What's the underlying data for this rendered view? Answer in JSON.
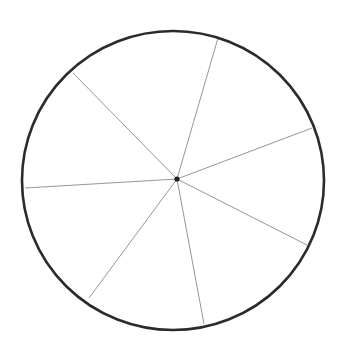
{
  "figure": {
    "background": "#ffffff",
    "circle": {
      "cx": 173,
      "cy": 180.5,
      "rx": 151,
      "ry": 149.5,
      "stroke": "#2b2b2b",
      "stroke_width": 2.6
    },
    "center_point": {
      "x": 177,
      "y": 179,
      "r": 2.6,
      "fill": "#1e1e1e"
    },
    "spoke_style": {
      "stroke": "#8a8a8a",
      "stroke_width": 0.9
    },
    "spokes": [
      {
        "x": 218,
        "y": 38
      },
      {
        "x": 73,
        "y": 73
      },
      {
        "x": 25,
        "y": 188
      },
      {
        "x": 89,
        "y": 298
      },
      {
        "x": 204,
        "y": 324
      },
      {
        "x": 307,
        "y": 245
      },
      {
        "x": 312,
        "y": 128
      }
    ]
  },
  "chart_data": {
    "type": "pie",
    "title": "",
    "labels": [
      "",
      "",
      "",
      "",
      "",
      "",
      ""
    ],
    "slice_count": 7,
    "values_degrees": [
      60.7,
      48.9,
      50.1,
      47.0,
      52.6,
      47.6,
      53.1
    ],
    "values_percent": [
      16.9,
      13.6,
      13.9,
      13.1,
      14.6,
      13.2,
      14.7
    ],
    "boundary_angles_degrees": [
      73.8,
      134.5,
      183.4,
      233.5,
      280.5,
      333.1,
      20.7
    ],
    "legend": "none"
  }
}
